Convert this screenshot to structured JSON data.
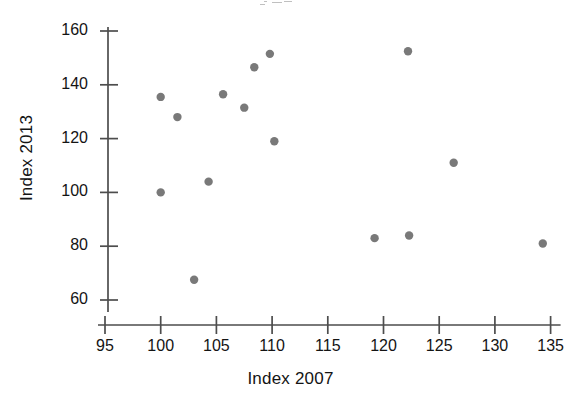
{
  "chart_data": {
    "type": "scatter",
    "title": "",
    "xlabel": "Index 2007",
    "ylabel": "Index 2013",
    "xlim": [
      93.5,
      136.5
    ],
    "ylim": [
      55,
      164
    ],
    "xticks": [
      95,
      100,
      105,
      110,
      115,
      120,
      125,
      130,
      135
    ],
    "yticks": [
      60,
      80,
      100,
      120,
      140,
      160
    ],
    "xtick_labels": [
      "95",
      "100",
      "105",
      "110",
      "115",
      "120",
      "125",
      "130",
      "135"
    ],
    "ytick_labels": [
      "60",
      "80",
      "100",
      "120",
      "140",
      "160"
    ],
    "grid": false,
    "legend": null,
    "marker": {
      "shape": "circle",
      "color": "#6e6e6e",
      "size": 6
    },
    "axis_color": "#4d4d4d",
    "series": [
      {
        "name": "Index 2007 vs Index 2013",
        "points": [
          {
            "x": 100.0,
            "y": 135.5
          },
          {
            "x": 101.5,
            "y": 128.0
          },
          {
            "x": 100.0,
            "y": 100.0
          },
          {
            "x": 103.0,
            "y": 67.5
          },
          {
            "x": 104.3,
            "y": 104.0
          },
          {
            "x": 105.6,
            "y": 136.5
          },
          {
            "x": 107.5,
            "y": 131.5
          },
          {
            "x": 108.4,
            "y": 146.5
          },
          {
            "x": 109.8,
            "y": 151.5
          },
          {
            "x": 110.2,
            "y": 119.0
          },
          {
            "x": 119.2,
            "y": 83.0
          },
          {
            "x": 122.2,
            "y": 152.5
          },
          {
            "x": 122.3,
            "y": 84.0
          },
          {
            "x": 126.3,
            "y": 111.0
          },
          {
            "x": 134.3,
            "y": 81.0
          }
        ]
      }
    ]
  },
  "axes": {
    "x_title": "Index 2007",
    "y_title": "Index 2013"
  }
}
